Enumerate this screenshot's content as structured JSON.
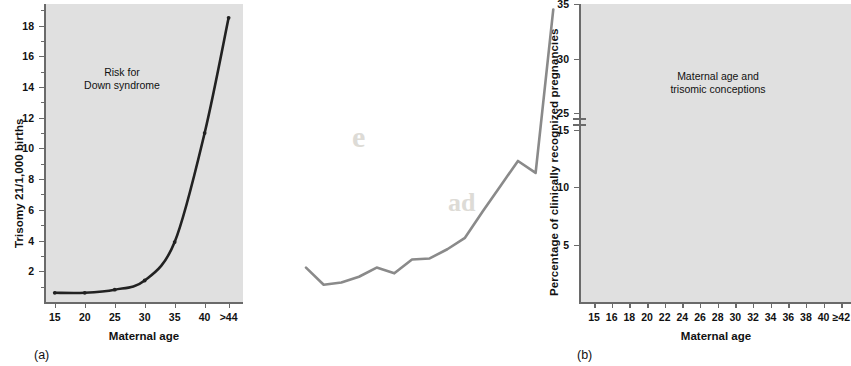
{
  "figure": {
    "background": "#ffffff",
    "plot_background": "#e0e0e0",
    "axis_color": "#6a6a6a"
  },
  "panel_a": {
    "caption": "(a)",
    "annotation_line1": "Risk for",
    "annotation_line2": "Down syndrome",
    "curve_color": "#222222",
    "chart_data": {
      "type": "line",
      "title": "Risk for Down syndrome",
      "xlabel": "Maternal age",
      "ylabel": "Trisomy 21/1,000 births",
      "x": [
        15,
        20,
        25,
        30,
        35,
        40,
        44
      ],
      "values": [
        0.6,
        0.6,
        0.8,
        1.4,
        3.9,
        11.0,
        18.5
      ],
      "xtick_labels": [
        "15",
        "20",
        "25",
        "30",
        "35",
        "40",
        ">44"
      ],
      "ytick_labels": [
        "2",
        "4",
        "6",
        "8",
        "10",
        "12",
        "14",
        "16",
        "18"
      ],
      "ytick_values": [
        2,
        4,
        6,
        8,
        10,
        12,
        14,
        16,
        18
      ],
      "ylim": [
        0,
        19.4
      ],
      "xlim": [
        13.2,
        46.4
      ],
      "grid": false,
      "legend": "none",
      "minor_ticks": true
    }
  },
  "panel_b": {
    "caption": "(b)",
    "annotation_line1": "Maternal age and",
    "annotation_line2": "trisomic conceptions",
    "curve_color": "#8a8a8a",
    "axis_break": true,
    "chart_data": {
      "type": "line",
      "title": "Maternal age and trisomic conceptions",
      "xlabel": "Maternal age",
      "ylabel": "Percentage of clinically recognized pregnancies",
      "x": [
        15,
        16,
        18,
        20,
        22,
        24,
        26,
        28,
        30,
        32,
        34,
        36,
        38,
        40,
        42
      ],
      "values": [
        3.0,
        1.5,
        1.7,
        2.2,
        3.0,
        2.5,
        3.7,
        3.8,
        4.6,
        5.6,
        7.9,
        10.1,
        12.3,
        19.5,
        34.5
      ],
      "xtick_labels": [
        "15",
        "16",
        "18",
        "20",
        "22",
        "24",
        "26",
        "28",
        "30",
        "32",
        "34",
        "36",
        "38",
        "40",
        "≥42"
      ],
      "ytick_labels": [
        "5",
        "10",
        "15",
        "25",
        "30",
        "35"
      ],
      "ytick_values": [
        5,
        10,
        15,
        25,
        30,
        35
      ],
      "ylim": [
        0,
        35
      ],
      "grid": false,
      "legend": "none",
      "note": "y-axis is broken between 15 and 25"
    }
  },
  "bleed_text": {
    "line1": "h lesp",
    "line2": "e",
    "line3": "ad"
  }
}
